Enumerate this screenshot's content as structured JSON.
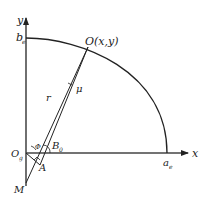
{
  "diagram": {
    "labels": {
      "y_axis": "y",
      "x_axis": "x",
      "b_e_main": "b",
      "b_e_sub": "e",
      "a_e_main": "a",
      "a_e_sub": "e",
      "point_O": "O(x,y)",
      "r": "r",
      "mu": "μ",
      "O_g_main": "O",
      "O_g_sub": "g",
      "B_0_main": "B",
      "B_0_sub": "0",
      "phi": "Φ",
      "A": "A",
      "M": "M"
    },
    "colors": {
      "stroke": "#222222",
      "background": "#ffffff"
    }
  }
}
